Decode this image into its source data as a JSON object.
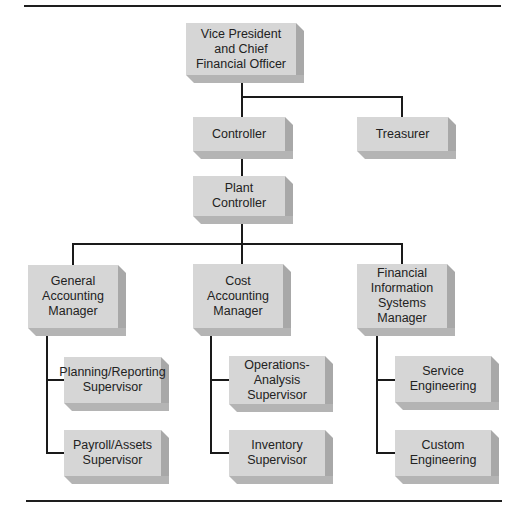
{
  "diagram": {
    "type": "organization-chart",
    "nodes": {
      "vp_cfo": {
        "label": "Vice President\nand Chief\nFinancial Officer"
      },
      "controller": {
        "label": "Controller"
      },
      "treasurer": {
        "label": "Treasurer"
      },
      "plant_controller": {
        "label": "Plant\nController"
      },
      "general_accounting_manager": {
        "label": "General\nAccounting\nManager"
      },
      "cost_accounting_manager": {
        "label": "Cost\nAccounting\nManager"
      },
      "fis_manager": {
        "label": "Financial\nInformation\nSystems\nManager"
      },
      "planning_reporting_supervisor": {
        "label": "Planning/Reporting\nSupervisor"
      },
      "payroll_assets_supervisor": {
        "label": "Payroll/Assets\nSupervisor"
      },
      "operations_analysis_supervisor": {
        "label": "Operations-\nAnalysis\nSupervisor"
      },
      "inventory_supervisor": {
        "label": "Inventory\nSupervisor"
      },
      "service_engineering": {
        "label": "Service\nEngineering"
      },
      "custom_engineering": {
        "label": "Custom\nEngineering"
      }
    },
    "edges": [
      [
        "vp_cfo",
        "controller"
      ],
      [
        "vp_cfo",
        "treasurer"
      ],
      [
        "controller",
        "plant_controller"
      ],
      [
        "plant_controller",
        "general_accounting_manager"
      ],
      [
        "plant_controller",
        "cost_accounting_manager"
      ],
      [
        "plant_controller",
        "fis_manager"
      ],
      [
        "general_accounting_manager",
        "planning_reporting_supervisor"
      ],
      [
        "general_accounting_manager",
        "payroll_assets_supervisor"
      ],
      [
        "cost_accounting_manager",
        "operations_analysis_supervisor"
      ],
      [
        "cost_accounting_manager",
        "inventory_supervisor"
      ],
      [
        "fis_manager",
        "service_engineering"
      ],
      [
        "fis_manager",
        "custom_engineering"
      ]
    ],
    "colors": {
      "box_face": "#d6d6d6",
      "box_side": "#a8a8a8",
      "line": "#1a1a1a"
    }
  }
}
